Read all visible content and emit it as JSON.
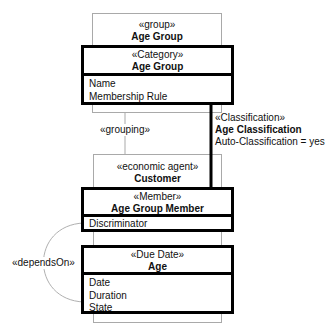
{
  "group_box": {
    "stereotype": "«group»",
    "name": "Age Group"
  },
  "category_box": {
    "stereotype": "«Category»",
    "name": "Age Group",
    "attributes": [
      "Name",
      "Membership Rule"
    ]
  },
  "grouping_link": {
    "label": "«grouping»"
  },
  "classification_link": {
    "stereotype": "«Classification»",
    "name": "Age Classification",
    "property": "Auto-Classification = yes"
  },
  "customer_box": {
    "stereotype": "«economic agent»",
    "name": "Customer"
  },
  "member_box": {
    "stereotype": "«Member»",
    "name": "Age Group Member",
    "attributes": [
      "Discriminator"
    ]
  },
  "due_date_box": {
    "stereotype": "«Due Date»",
    "name": "Age",
    "attributes": [
      "Date",
      "Duration",
      "State"
    ]
  },
  "depends_link": {
    "label": "«dependsOn»"
  },
  "colors": {
    "thin_border": "#a9a9a9",
    "thick_border": "#000000",
    "arc": "#b0b0b0"
  }
}
